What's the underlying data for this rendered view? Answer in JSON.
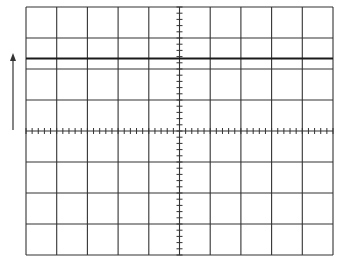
{
  "graticule": {
    "left": 26,
    "top": 7,
    "right": 333,
    "bottom": 255,
    "divisions_x": 10,
    "divisions_y": 8,
    "minor_ticks_per_division": 5,
    "grid_color": "#333333",
    "grid_width": 1.1
  },
  "trace": {
    "y": 58.5,
    "color": "#1a1a1a",
    "width": 1.8
  },
  "arrow": {
    "x": 13,
    "y_tail": 130,
    "y_head": 53,
    "color": "#333333",
    "direction": "up"
  }
}
